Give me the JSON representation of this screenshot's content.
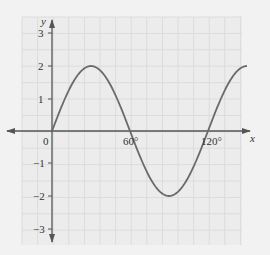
{
  "chart_data": {
    "type": "line",
    "title": "",
    "xlabel": "x",
    "ylabel": "y",
    "x_ticks": [
      "0",
      "60°",
      "120°"
    ],
    "y_ticks": [
      "3",
      "2",
      "1",
      "-1",
      "-2",
      "-3"
    ],
    "xlim": [
      0,
      150
    ],
    "ylim": [
      -3,
      3
    ],
    "grid": true,
    "series": [
      {
        "name": "y = 2 sin 3x",
        "x": [
          0,
          15,
          30,
          45,
          60,
          75,
          90,
          105,
          120,
          135,
          150
        ],
        "values": [
          0,
          1.41,
          2,
          1.41,
          0,
          -1.41,
          -2,
          -1.41,
          0,
          1.41,
          2
        ]
      }
    ]
  },
  "labels": {
    "x_axis": "x",
    "y_axis": "y",
    "origin": "0",
    "x60": "60°",
    "x120": "120°",
    "y3": "3",
    "y2": "2",
    "y1": "1",
    "ym1": "−1",
    "ym2": "−2",
    "ym3": "−3"
  }
}
